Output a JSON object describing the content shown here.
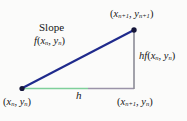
{
  "figure": {
    "labels": {
      "slope_title": "Slope",
      "slope_function": {
        "f": "f",
        "open": "(",
        "x": "x",
        "x_sub": "n",
        "comma": ", ",
        "y": "y",
        "y_sub": "n",
        "close": ")"
      },
      "top_right_point": {
        "open": "(",
        "x": "x",
        "x_sub": "n+1",
        "comma": ", ",
        "y": "y",
        "y_sub": "n+1",
        "close": ")"
      },
      "bottom_left_point": {
        "open": "(",
        "x": "x",
        "x_sub": "n",
        "comma": ", ",
        "y": "y",
        "y_sub": "n",
        "close": ")"
      },
      "bottom_right_point": {
        "open": "(",
        "x": "x",
        "x_sub": "n+1",
        "comma": ", ",
        "y": "y",
        "y_sub": "n",
        "close": ")"
      },
      "rise": {
        "h": "h",
        "f": "f",
        "open": "(",
        "x": "x",
        "x_sub": "n",
        "comma": ", ",
        "y": "y",
        "y_sub": "n",
        "close": ")"
      },
      "run": "h"
    },
    "colors": {
      "hypotenuse": "#1f2a8c",
      "vertical_side": "#8c8c96",
      "base_left": "#7fcf9a",
      "base_right": "#9a93a8",
      "vertex_dot": "#15163a",
      "background": "#fbfbfa",
      "text": "#161616"
    },
    "geometry": {
      "bottom_left_vertex": [
        22,
        88
      ],
      "top_right_vertex": [
        134,
        30
      ],
      "bottom_right_vertex": [
        134,
        88
      ]
    }
  }
}
